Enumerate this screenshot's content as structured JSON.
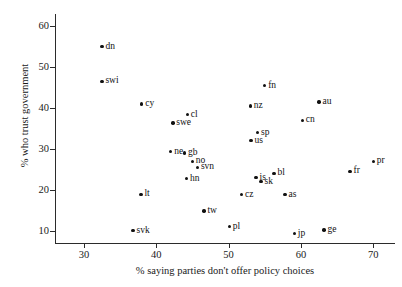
{
  "chart_data": {
    "type": "scatter",
    "title": "",
    "xlabel": "% saying parties don't offer policy choices",
    "ylabel": "% who trust government",
    "xlim": [
      26,
      73
    ],
    "ylim": [
      7,
      63
    ],
    "xticks": [
      30,
      40,
      50,
      60,
      70
    ],
    "yticks": [
      10,
      20,
      30,
      40,
      50,
      60
    ],
    "grid": false,
    "legend": "none",
    "points": [
      {
        "label": "dn",
        "x": 32.5,
        "y": 55.0,
        "label_pos": "right"
      },
      {
        "label": "swi",
        "x": 32.5,
        "y": 46.5,
        "label_pos": "right"
      },
      {
        "label": "cy",
        "x": 38.0,
        "y": 41.0,
        "label_pos": "right"
      },
      {
        "label": "cl",
        "x": 44.3,
        "y": 38.4,
        "label_pos": "right"
      },
      {
        "label": "swe",
        "x": 42.3,
        "y": 36.3,
        "label_pos": "right"
      },
      {
        "label": "ne",
        "x": 42.0,
        "y": 29.3,
        "label_pos": "right"
      },
      {
        "label": "gb",
        "x": 43.9,
        "y": 29.0,
        "label_pos": "right"
      },
      {
        "label": "no",
        "x": 45.0,
        "y": 27.0,
        "label_pos": "right"
      },
      {
        "label": "svn",
        "x": 45.7,
        "y": 25.5,
        "label_pos": "right"
      },
      {
        "label": "hn",
        "x": 44.2,
        "y": 22.7,
        "label_pos": "right"
      },
      {
        "label": "lt",
        "x": 37.9,
        "y": 18.9,
        "label_pos": "right"
      },
      {
        "label": "tw",
        "x": 46.6,
        "y": 14.8,
        "label_pos": "right"
      },
      {
        "label": "svk",
        "x": 36.8,
        "y": 10.0,
        "label_pos": "right"
      },
      {
        "label": "pl",
        "x": 50.1,
        "y": 11.0,
        "label_pos": "right"
      },
      {
        "label": "cz",
        "x": 51.8,
        "y": 18.8,
        "label_pos": "right"
      },
      {
        "label": "is",
        "x": 53.8,
        "y": 23.0,
        "label_pos": "right"
      },
      {
        "label": "sk",
        "x": 54.5,
        "y": 22.0,
        "label_pos": "right"
      },
      {
        "label": "bl",
        "x": 56.3,
        "y": 24.0,
        "label_pos": "right"
      },
      {
        "label": "as",
        "x": 57.8,
        "y": 18.8,
        "label_pos": "right"
      },
      {
        "label": "us",
        "x": 53.1,
        "y": 32.0,
        "label_pos": "right"
      },
      {
        "label": "sp",
        "x": 54.0,
        "y": 34.0,
        "label_pos": "right"
      },
      {
        "label": "nz",
        "x": 53.0,
        "y": 40.5,
        "label_pos": "right"
      },
      {
        "label": "fn",
        "x": 55.0,
        "y": 45.5,
        "label_pos": "right"
      },
      {
        "label": "cn",
        "x": 60.2,
        "y": 37.0,
        "label_pos": "right"
      },
      {
        "label": "au",
        "x": 62.5,
        "y": 41.5,
        "label_pos": "right"
      },
      {
        "label": "jp",
        "x": 59.1,
        "y": 9.3,
        "label_pos": "right"
      },
      {
        "label": "ge",
        "x": 63.2,
        "y": 10.2,
        "label_pos": "right"
      },
      {
        "label": "fr",
        "x": 66.8,
        "y": 24.5,
        "label_pos": "right"
      },
      {
        "label": "pr",
        "x": 70.0,
        "y": 27.0,
        "label_pos": "right"
      }
    ]
  }
}
